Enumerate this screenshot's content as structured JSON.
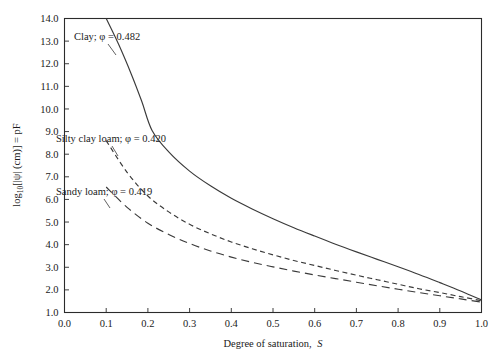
{
  "chart_data": {
    "type": "line",
    "title": "",
    "xlabel": "Degree of saturation, S",
    "ylabel": "log10[|ψ| (cm)] = pF",
    "xlim": [
      0.0,
      1.0
    ],
    "ylim": [
      1.0,
      14.0
    ],
    "grid": false,
    "legend_position": "inline-annotations",
    "xticks": [
      "0.0",
      "0.1",
      "0.2",
      "0.3",
      "0.4",
      "0.5",
      "0.6",
      "0.7",
      "0.8",
      "0.9",
      "1.0"
    ],
    "xtick_values": [
      0.0,
      0.1,
      0.2,
      0.3,
      0.4,
      0.5,
      0.6,
      0.7,
      0.8,
      0.9,
      1.0
    ],
    "yticks": [
      "1.0",
      "2.0",
      "3.0",
      "4.0",
      "5.0",
      "6.0",
      "7.0",
      "8.0",
      "9.0",
      "10.0",
      "11.0",
      "12.0",
      "13.0",
      "14.0"
    ],
    "ytick_values": [
      1.0,
      2.0,
      3.0,
      4.0,
      5.0,
      6.0,
      7.0,
      8.0,
      9.0,
      10.0,
      11.0,
      12.0,
      13.0,
      14.0
    ],
    "series": [
      {
        "name": "Clay",
        "label": "Clay; φ = 0.482",
        "porosity": 0.482,
        "linestyle": "solid",
        "x": [
          0.1,
          0.13,
          0.16,
          0.185,
          0.21,
          0.25,
          0.3,
          0.35,
          0.4,
          0.45,
          0.5,
          0.55,
          0.6,
          0.65,
          0.7,
          0.75,
          0.8,
          0.85,
          0.9,
          0.95,
          1.0
        ],
        "y": [
          14.0,
          12.85,
          11.55,
          10.35,
          9.05,
          8.1,
          7.25,
          6.6,
          6.05,
          5.58,
          5.15,
          4.75,
          4.38,
          4.02,
          3.68,
          3.35,
          3.02,
          2.68,
          2.32,
          1.95,
          1.55
        ]
      },
      {
        "name": "Silty clay loam",
        "label": "Silty clay loam; φ = 0.420",
        "porosity": 0.42,
        "linestyle": "short-dash",
        "x": [
          0.1,
          0.15,
          0.2,
          0.25,
          0.3,
          0.35,
          0.4,
          0.45,
          0.5,
          0.55,
          0.6,
          0.65,
          0.7,
          0.75,
          0.8,
          0.85,
          0.9,
          0.95,
          1.0
        ],
        "y": [
          8.6,
          7.2,
          6.15,
          5.45,
          4.9,
          4.48,
          4.12,
          3.82,
          3.55,
          3.3,
          3.08,
          2.86,
          2.65,
          2.45,
          2.25,
          2.05,
          1.88,
          1.7,
          1.52
        ]
      },
      {
        "name": "Sandy loam",
        "label": "Sandy loam; φ = 0.419",
        "porosity": 0.419,
        "linestyle": "long-dash",
        "x": [
          0.1,
          0.15,
          0.2,
          0.25,
          0.3,
          0.35,
          0.4,
          0.45,
          0.5,
          0.55,
          0.6,
          0.65,
          0.7,
          0.75,
          0.8,
          0.85,
          0.9,
          0.95,
          1.0
        ],
        "y": [
          6.55,
          5.65,
          4.95,
          4.45,
          4.05,
          3.72,
          3.45,
          3.22,
          3.02,
          2.83,
          2.66,
          2.5,
          2.34,
          2.18,
          2.03,
          1.88,
          1.74,
          1.6,
          1.46
        ]
      }
    ],
    "annotations": [
      {
        "text": "Clay; φ = 0.482",
        "x_px": 74,
        "y_px": 40
      },
      {
        "text": "Silty clay loam; φ = 0.420",
        "x_px": 56,
        "y_px": 142
      },
      {
        "text": "Sandy loam; φ = 0.419",
        "x_px": 56,
        "y_px": 195
      }
    ],
    "colors": {
      "background": "#ffffff",
      "axis": "#2b2b2b",
      "curve": "#3a3a3a",
      "text": "#1a1a1a"
    }
  },
  "axes": {
    "x_title_main": "Degree of saturation,",
    "x_title_symbol": "S",
    "y_title_prefix": "log",
    "y_title_sub": "10",
    "y_title_rest": "[|ψ| (cm)] = pF"
  },
  "labels": {
    "clay": "Clay; φ = 0.482",
    "silty_clay_loam": "Silty clay loam; φ = 0.420",
    "sandy_loam": "Sandy loam; φ = 0.419"
  }
}
